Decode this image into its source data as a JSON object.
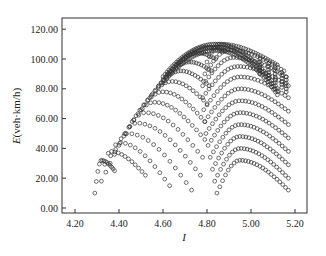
{
  "chart_data": {
    "type": "scatter",
    "title": "",
    "xlabel": "I",
    "ylabel_italic": "E",
    "ylabel_rest": "(veh·km/h)",
    "ylabel": "E(veh·km/h)",
    "xlim": [
      4.15,
      5.25
    ],
    "ylim": [
      -5,
      127
    ],
    "x_ticks": [
      4.2,
      4.4,
      4.6,
      4.8,
      5.0,
      5.2
    ],
    "x_tick_labels": [
      "4.20",
      "4.40",
      "4.60",
      "4.80",
      "5.00",
      "5.20"
    ],
    "y_ticks": [
      0,
      20,
      40,
      60,
      80,
      100,
      120
    ],
    "y_tick_labels": [
      "0.00",
      "20.00",
      "40.00",
      "60.00",
      "80.00",
      "100.00",
      "120.00"
    ],
    "grid": false,
    "legend": null,
    "marker": "open-circle",
    "marker_color": "#333333",
    "envelope_peak": {
      "I": 4.84,
      "E": 110
    },
    "left_family": {
      "description": "arcs rising from the left envelope, each peaking on the rising envelope and descending to the right",
      "arcs": [
        {
          "i_start": 4.29,
          "e_start": 10,
          "i_peak": 4.32,
          "e_peak": 32,
          "i_end": 4.38,
          "e_end": 25,
          "n": 14
        },
        {
          "i_start": 4.32,
          "e_start": 18,
          "i_peak": 4.36,
          "e_peak": 38,
          "i_end": 4.52,
          "e_end": 22,
          "n": 14
        },
        {
          "i_start": 4.34,
          "e_start": 24,
          "i_peak": 4.4,
          "e_peak": 44,
          "i_end": 4.63,
          "e_end": 15,
          "n": 14
        },
        {
          "i_start": 4.36,
          "e_start": 30,
          "i_peak": 4.44,
          "e_peak": 50,
          "i_end": 4.73,
          "e_end": 12,
          "n": 16
        },
        {
          "i_start": 4.38,
          "e_start": 36,
          "i_peak": 4.48,
          "e_peak": 57,
          "i_end": 4.77,
          "e_end": 22,
          "n": 18
        },
        {
          "i_start": 4.4,
          "e_start": 42,
          "i_peak": 4.52,
          "e_peak": 64,
          "i_end": 4.78,
          "e_end": 34,
          "n": 18
        },
        {
          "i_start": 4.43,
          "e_start": 50,
          "i_peak": 4.56,
          "e_peak": 71,
          "i_end": 4.79,
          "e_end": 46,
          "n": 20
        },
        {
          "i_start": 4.46,
          "e_start": 58,
          "i_peak": 4.6,
          "e_peak": 78,
          "i_end": 4.79,
          "e_end": 58,
          "n": 20
        },
        {
          "i_start": 4.5,
          "e_start": 66,
          "i_peak": 4.64,
          "e_peak": 85,
          "i_end": 4.8,
          "e_end": 70,
          "n": 20
        },
        {
          "i_start": 4.54,
          "e_start": 74,
          "i_peak": 4.68,
          "e_peak": 92,
          "i_end": 4.81,
          "e_end": 82,
          "n": 22
        },
        {
          "i_start": 4.58,
          "e_start": 82,
          "i_peak": 4.72,
          "e_peak": 98,
          "i_end": 4.82,
          "e_end": 92,
          "n": 22
        },
        {
          "i_start": 4.62,
          "e_start": 90,
          "i_peak": 4.76,
          "e_peak": 104,
          "i_end": 4.84,
          "e_end": 100,
          "n": 22
        },
        {
          "i_start": 4.66,
          "e_start": 96,
          "i_peak": 4.8,
          "e_peak": 108,
          "i_end": 4.88,
          "e_end": 106,
          "n": 22
        }
      ]
    },
    "right_family": {
      "description": "nested arcs starting near I≈4.78-4.85 and ending near I≈5.17",
      "arcs": [
        {
          "i_start": 4.845,
          "e_start": 10,
          "i_peak": 4.95,
          "e_peak": 32,
          "i_end": 5.17,
          "e_end": 12,
          "n": 26
        },
        {
          "i_start": 4.835,
          "e_start": 18,
          "i_peak": 4.95,
          "e_peak": 40,
          "i_end": 5.17,
          "e_end": 20,
          "n": 26
        },
        {
          "i_start": 4.825,
          "e_start": 26,
          "i_peak": 4.95,
          "e_peak": 48,
          "i_end": 5.17,
          "e_end": 29,
          "n": 26
        },
        {
          "i_start": 4.815,
          "e_start": 34,
          "i_peak": 4.95,
          "e_peak": 56,
          "i_end": 5.17,
          "e_end": 38,
          "n": 26
        },
        {
          "i_start": 4.805,
          "e_start": 42,
          "i_peak": 4.95,
          "e_peak": 64,
          "i_end": 5.17,
          "e_end": 47,
          "n": 26
        },
        {
          "i_start": 4.795,
          "e_start": 50,
          "i_peak": 4.95,
          "e_peak": 72,
          "i_end": 5.17,
          "e_end": 56,
          "n": 26
        },
        {
          "i_start": 4.79,
          "e_start": 58,
          "i_peak": 4.95,
          "e_peak": 80,
          "i_end": 5.17,
          "e_end": 65,
          "n": 26
        },
        {
          "i_start": 4.785,
          "e_start": 66,
          "i_peak": 4.95,
          "e_peak": 88,
          "i_end": 5.17,
          "e_end": 74,
          "n": 26
        },
        {
          "i_start": 4.78,
          "e_start": 74,
          "i_peak": 4.94,
          "e_peak": 95,
          "i_end": 5.17,
          "e_end": 82,
          "n": 28
        },
        {
          "i_start": 4.78,
          "e_start": 82,
          "i_peak": 4.92,
          "e_peak": 101,
          "i_end": 5.16,
          "e_end": 88,
          "n": 28
        },
        {
          "i_start": 4.79,
          "e_start": 90,
          "i_peak": 4.9,
          "e_peak": 106,
          "i_end": 5.15,
          "e_end": 92,
          "n": 28
        },
        {
          "i_start": 4.8,
          "e_start": 98,
          "i_peak": 4.86,
          "e_peak": 110,
          "i_end": 5.12,
          "e_end": 96,
          "n": 30
        }
      ]
    },
    "scallop_peaks": [
      {
        "I": 5.04,
        "E": 100
      },
      {
        "I": 5.08,
        "E": 97
      },
      {
        "I": 5.11,
        "E": 94
      },
      {
        "I": 5.14,
        "E": 91
      },
      {
        "I": 5.16,
        "E": 88
      }
    ]
  }
}
